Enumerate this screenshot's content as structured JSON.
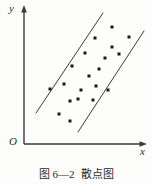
{
  "figure": {
    "caption_number": "图 6—2",
    "caption_title": "散点图",
    "background_color": "#fdfdfc",
    "ink_color": "#3a3a3a",
    "point_color": "#1a1a1a"
  },
  "axes": {
    "y_label": "y",
    "x_label": "x",
    "origin_label": "O",
    "y_axis": {
      "x": 24,
      "y_top": 6,
      "y_bottom": 144
    },
    "x_axis": {
      "y": 144,
      "x_left": 24,
      "x_right": 146
    }
  },
  "chart_data": {
    "type": "scatter",
    "title": "散点图",
    "xlabel": "x",
    "ylabel": "y",
    "grid": false,
    "legend": false,
    "axis_arrows": true,
    "origin_label": "O",
    "note": "Positive linear correlation scatter enclosed by two parallel boundary lines",
    "points_px": [
      [
        112,
        27
      ],
      [
        95,
        38
      ],
      [
        129,
        37
      ],
      [
        112,
        47
      ],
      [
        85,
        53
      ],
      [
        105,
        58
      ],
      [
        119,
        54
      ],
      [
        99,
        69
      ],
      [
        72,
        66
      ],
      [
        89,
        76
      ],
      [
        64,
        84
      ],
      [
        96,
        86
      ],
      [
        81,
        90
      ],
      [
        50,
        89
      ],
      [
        78,
        99
      ],
      [
        93,
        100
      ],
      [
        70,
        101
      ],
      [
        59,
        114
      ],
      [
        70,
        121
      ],
      [
        108,
        90
      ]
    ],
    "boundary_lines_px": [
      {
        "name": "upper-left-boundary",
        "x1": 36,
        "y1": 113,
        "x2": 103,
        "y2": 13
      },
      {
        "name": "lower-right-boundary",
        "x1": 78,
        "y1": 132,
        "x2": 144,
        "y2": 31
      }
    ],
    "point_size_px": 3
  }
}
